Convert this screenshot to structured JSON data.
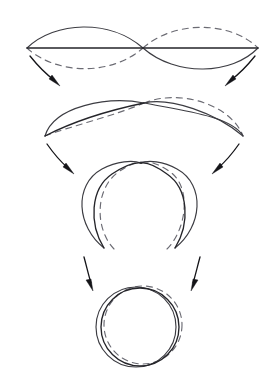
{
  "figure": {
    "background_color": "#ffffff",
    "solid_stroke_color": "#3c3c42",
    "dark_stroke_color": "#25252a",
    "dashed_stroke_color": "#6b6b73",
    "arrow_color": "#141418",
    "stage_count": 4,
    "transition_count": 3
  },
  "stages": [
    {
      "id": "stage-1-lemniscate",
      "label": "Stage 1 - flat figure eight",
      "shape": "lemniscate",
      "crossing_point": {
        "x": 143,
        "y": 48
      },
      "left_node": {
        "x": 27,
        "y": 48
      },
      "right_node": {
        "x": 258,
        "y": 48
      },
      "solid_paths": [
        "M27,48 C55,22 110,20 143,48",
        "M143,48 C176,76 232,74 258,48",
        "M27,48 L143,48",
        "M143,48 L258,48"
      ],
      "dashed_paths": [
        "M27,48 C55,74 110,76 143,48",
        "M143,48 C176,20 232,22 258,48"
      ]
    },
    {
      "id": "stage-2-opening",
      "label": "Stage 2 - lobes lifting",
      "shape": "opening-eight",
      "crossing_point": {
        "x": 143,
        "y": 103
      },
      "left_node": {
        "x": 45,
        "y": 136
      },
      "right_node": {
        "x": 243,
        "y": 136
      },
      "solid_paths": [
        "M45,136 C58,104 110,98 143,103",
        "M143,103 C178,108 228,114 243,136",
        "M45,136 C80,116 120,108 143,103",
        "M143,103 C170,98 215,112 243,136"
      ],
      "dashed_paths": [
        "M45,136 C70,126 115,116 143,103",
        "M143,103 C176,90 228,104 243,136"
      ]
    },
    {
      "id": "stage-3-closing-loop",
      "label": "Stage 3 - lobes closing into a loop",
      "shape": "open-loop",
      "crossing_point": {
        "x": 140,
        "y": 163
      },
      "left_tip": {
        "x": 103,
        "y": 248
      },
      "right_tip": {
        "x": 176,
        "y": 248
      },
      "solid_paths": [
        "M103,248 C76,228 72,186 101,170 C116,162 132,161 140,163",
        "M176,248 C203,228 207,186 178,170 C164,162 148,161 140,163",
        "M103,248 C88,224 90,188 112,174 C124,166 134,163 140,163",
        "M176,248 C191,224 189,188 167,174 C155,166 146,163 140,163"
      ],
      "dashed_paths": [
        "M113,248 C92,226 94,186 116,172 C128,164 136,163 142,163",
        "M168,248 C188,226 192,184 168,170 C156,163 148,162 142,163"
      ]
    },
    {
      "id": "stage-4-circle",
      "label": "Stage 4 - closed circle",
      "shape": "circle",
      "center": {
        "x": 139,
        "y": 327
      },
      "radius": 40,
      "solid_circles": [
        {
          "cx": 139,
          "cy": 327,
          "r": 40
        },
        {
          "cx": 136,
          "cy": 327,
          "r": 40
        }
      ],
      "dashed_circles": [
        {
          "cx": 143,
          "cy": 325,
          "r": 39
        }
      ]
    }
  ],
  "transitions": [
    {
      "id": "transition-1",
      "from_stage": "stage-1-lemniscate",
      "to_stage": "stage-2-opening",
      "arrows": [
        {
          "name": "arrow-left-1",
          "x1": 31,
          "y1": 57,
          "x2": 56,
          "y2": 84,
          "direction": "down-right"
        },
        {
          "name": "arrow-right-1",
          "x1": 254,
          "y1": 57,
          "x2": 231,
          "y2": 84,
          "direction": "down-left"
        }
      ]
    },
    {
      "id": "transition-2",
      "from_stage": "stage-2-opening",
      "to_stage": "stage-3-closing-loop",
      "arrows": [
        {
          "name": "arrow-left-2",
          "x1": 47,
          "y1": 145,
          "x2": 70,
          "y2": 172,
          "direction": "down-right"
        },
        {
          "name": "arrow-right-2",
          "x1": 238,
          "y1": 145,
          "x2": 215,
          "y2": 172,
          "direction": "down-left"
        }
      ]
    },
    {
      "id": "transition-3",
      "from_stage": "stage-3-closing-loop",
      "to_stage": "stage-4-circle",
      "arrows": [
        {
          "name": "arrow-left-3",
          "x1": 84,
          "y1": 258,
          "x2": 92,
          "y2": 287,
          "direction": "down"
        },
        {
          "name": "arrow-right-3",
          "x1": 199,
          "y1": 258,
          "x2": 192,
          "y2": 287,
          "direction": "down"
        }
      ]
    }
  ]
}
